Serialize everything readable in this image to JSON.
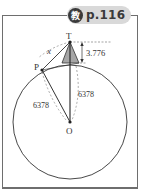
{
  "badge": {
    "icon_label": "教",
    "page_ref": "p.116"
  },
  "diagram": {
    "points": {
      "T": "T",
      "P": "P",
      "O": "O"
    },
    "labels": {
      "tangent_length": "x",
      "height": "3.776",
      "radius_right": "6378",
      "radius_left": "6378"
    },
    "colors": {
      "stroke": "#333333",
      "tower_fill": "#a6a6a6",
      "badge_bg": "#d9d9d9",
      "badge_icon_bg": "#3a3a3a",
      "frame": "#6e6e6e"
    }
  }
}
